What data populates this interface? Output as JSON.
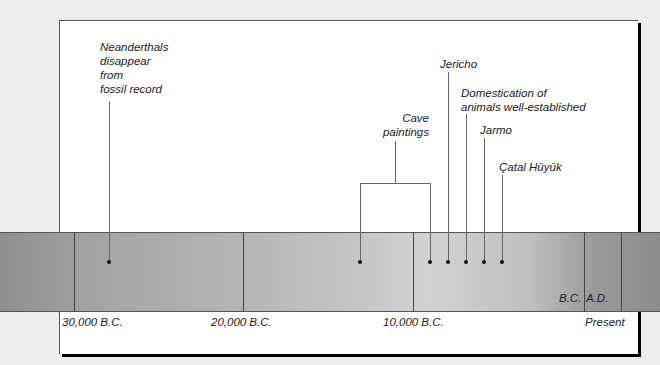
{
  "diagram": {
    "type": "timeline",
    "events": [
      {
        "id": "neanderthals",
        "lines": [
          "Neanderthals",
          "disappear",
          "from",
          "fossil record"
        ]
      },
      {
        "id": "cave-paintings",
        "lines": [
          "Cave",
          "paintings"
        ]
      },
      {
        "id": "jericho",
        "lines": [
          "Jericho"
        ]
      },
      {
        "id": "domestication",
        "lines": [
          "Domestication of",
          "animals well-established"
        ]
      },
      {
        "id": "jarmo",
        "lines": [
          "Jarmo"
        ]
      },
      {
        "id": "catal-huyuk",
        "lines": [
          "Çatal Hüyük"
        ]
      }
    ],
    "axis_labels": {
      "t30000": "30,000 B.C.",
      "t20000": "20,000 B.C.",
      "t10000": "10,000 B.C.",
      "present": "Present",
      "bc": "B.C.",
      "ad": "A.D."
    }
  }
}
